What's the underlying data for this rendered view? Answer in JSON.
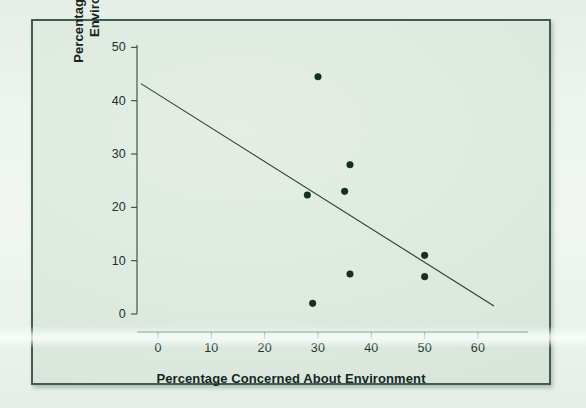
{
  "figure": {
    "background_color": "#dfeae1",
    "frame_color": "#3f5d52",
    "page_color": "#eaf1ea",
    "marker_color": "#14301f",
    "line_color": "#2c4036"
  },
  "chart_data": {
    "type": "scatter",
    "title": "",
    "xlabel": "Percentage Concerned About Environment",
    "ylabel_line1": "Percentage Donating Money to",
    "ylabel_line2": "Environmental Groups",
    "ylabel": "Percentage Donating Money to Environmental Groups",
    "xlim": [
      -4,
      65
    ],
    "ylim": [
      -3,
      52
    ],
    "xticks": [
      0,
      10,
      20,
      30,
      40,
      50,
      60
    ],
    "xtick_labels": [
      "0",
      "10",
      "20",
      "30",
      "40",
      "50",
      "60"
    ],
    "yticks": [
      0,
      10,
      20,
      30,
      40,
      50
    ],
    "ytick_labels": [
      "0",
      "10",
      "20",
      "30",
      "40",
      "50"
    ],
    "grid": false,
    "legend": "none",
    "points": [
      {
        "x": 30,
        "y": 44.5
      },
      {
        "x": 36,
        "y": 28
      },
      {
        "x": 28,
        "y": 22.3
      },
      {
        "x": 35,
        "y": 23
      },
      {
        "x": 36,
        "y": 7.5
      },
      {
        "x": 50,
        "y": 11
      },
      {
        "x": 50,
        "y": 7
      },
      {
        "x": 29,
        "y": 2
      }
    ],
    "fit_line": {
      "name": "regression line",
      "x_start": -3.2,
      "y_start": 43.2,
      "x_end": 63,
      "y_end": 1.5
    }
  }
}
